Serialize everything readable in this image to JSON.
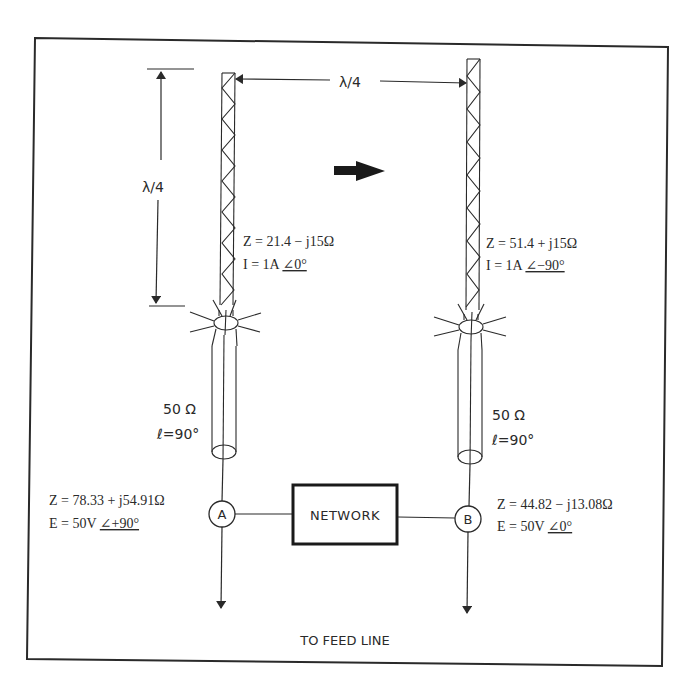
{
  "diagram": {
    "type": "antenna-phasing-network",
    "colors": {
      "ink": "#2a2a2a",
      "background": "#ffffff"
    },
    "spacing_label": "λ/4",
    "height_label": "λ/4",
    "direction_arrow": "right-arrow",
    "left_tower": {
      "impedance": "Z = 21.4 − j15Ω",
      "current_prefix": "I = 1A ",
      "current_angle": "∠0°"
    },
    "right_tower": {
      "impedance": "Z = 51.4 + j15Ω",
      "current_prefix": "I = 1A ",
      "current_angle": "∠−90°"
    },
    "left_line": {
      "impedance": "50 Ω",
      "length": "ℓ=90°"
    },
    "right_line": {
      "impedance": "50 Ω",
      "length": "ℓ=90°"
    },
    "node_a": {
      "label": "A",
      "impedance": "Z = 78.33 + j54.91Ω",
      "voltage_prefix": "E = 50V ",
      "voltage_angle": "∠+90°"
    },
    "node_b": {
      "label": "B",
      "impedance": "Z = 44.82 − j13.08Ω",
      "voltage_prefix": "E = 50V ",
      "voltage_angle": "∠0°"
    },
    "network_label": "NETWORK",
    "feed_label": "TO FEED LINE"
  }
}
